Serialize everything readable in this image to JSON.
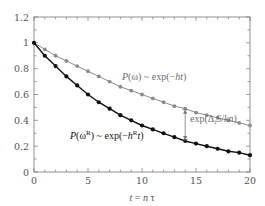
{
  "chart_data": {
    "type": "line",
    "title": "",
    "xlabel": "t = n τ",
    "ylabel": "",
    "xlim": [
      0,
      20
    ],
    "ylim": [
      0,
      1.2
    ],
    "x_ticks": [
      0,
      5,
      10,
      15,
      20
    ],
    "x_tick_labels": [
      "0",
      "5",
      "10",
      "15",
      "20"
    ],
    "y_ticks": [
      0,
      0.2,
      0.4,
      0.6,
      0.8,
      1,
      1.2
    ],
    "y_tick_labels": [
      "0",
      "0.2",
      "0.4",
      "0.6",
      "0.8",
      "1",
      "1.2"
    ],
    "grid": false,
    "x": [
      0,
      1,
      2,
      3,
      4,
      5,
      6,
      7,
      8,
      9,
      10,
      11,
      12,
      13,
      14,
      15,
      16,
      17,
      18,
      19,
      20
    ],
    "series": [
      {
        "name": "P(ω) ~ exp(−ht)",
        "color": "#8a8a8a",
        "marker": "circle",
        "values": [
          1.0,
          0.95,
          0.9,
          0.86,
          0.82,
          0.78,
          0.74,
          0.7,
          0.66,
          0.63,
          0.6,
          0.57,
          0.54,
          0.51,
          0.49,
          0.46,
          0.44,
          0.42,
          0.4,
          0.38,
          0.36
        ]
      },
      {
        "name": "P(ω^R) ~ exp(−h^R t)",
        "color": "#111111",
        "marker": "circle",
        "values": [
          1.0,
          0.9,
          0.82,
          0.74,
          0.67,
          0.6,
          0.54,
          0.49,
          0.44,
          0.4,
          0.36,
          0.33,
          0.3,
          0.27,
          0.24,
          0.22,
          0.2,
          0.18,
          0.16,
          0.15,
          0.13
        ]
      }
    ],
    "annotations": [
      {
        "text_prefix": "P(ω) ~ exp(−",
        "text_italic": "ht",
        "text_suffix": ")",
        "label": "P(ω) ~ exp(−ht)",
        "x": 9,
        "y": 0.67
      },
      {
        "label": "P(ω^R) ~ exp(−h^R t)",
        "x": 3.3,
        "y": 0.37
      },
      {
        "label": "exp(Δ_i S/kn)",
        "arrow_x": 14,
        "arrow_from": 0.49,
        "arrow_to": 0.24
      }
    ]
  },
  "labels": {
    "gray_curve": {
      "P": "P",
      "open": "(ω) ~ exp(−",
      "ht": "ht",
      "close": ")"
    },
    "black_curve": {
      "P": "P",
      "open": "(ω",
      "sup_R": "R",
      "mid": ") ~ exp(−",
      "h": "h",
      "sup_R2": "R",
      "t": "t",
      "close": ")"
    },
    "arrow_label": {
      "exp": "exp(Δ",
      "sub_i": "i",
      "S": "S",
      "slash": "/",
      "kn": "kn",
      "close": ")"
    },
    "xlabel": {
      "t": "t",
      "eq": " = ",
      "n": "n",
      "tau": " τ"
    }
  }
}
